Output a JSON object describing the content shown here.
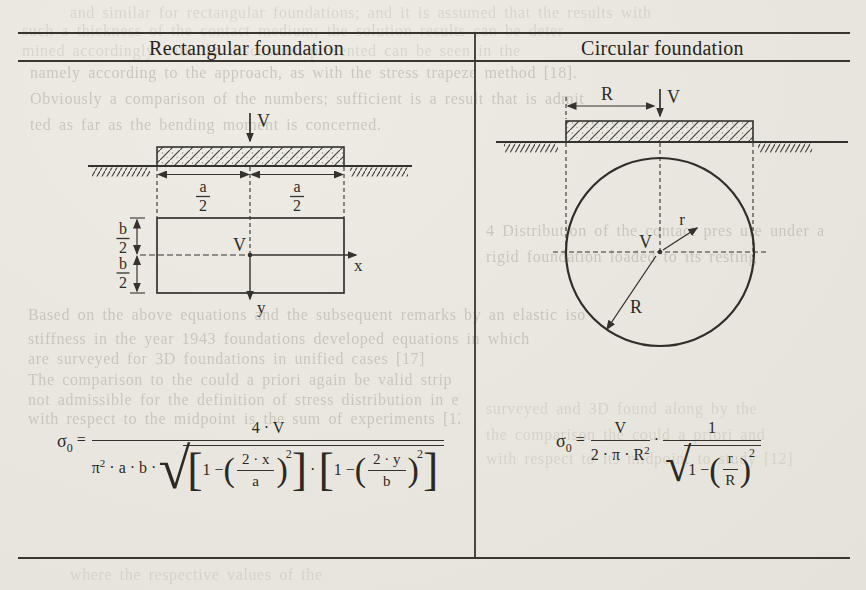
{
  "header": {
    "left": "Rectangular foundation",
    "right": "Circular foundation"
  },
  "rect_diagram": {
    "load_label": "V",
    "dim_a1_num": "a",
    "dim_a1_den": "2",
    "dim_a2_num": "a",
    "dim_a2_den": "2",
    "dim_b1_num": "b",
    "dim_b1_den": "2",
    "dim_b2_num": "b",
    "dim_b2_den": "2",
    "center_label": "V",
    "x_axis_label": "x",
    "y_axis_label": "y"
  },
  "circle_diagram": {
    "radius_dim_label": "R",
    "load_label": "V",
    "center_label": "V",
    "inner_radius_label": "r",
    "radius_label": "R"
  },
  "rect_formula": {
    "sigma": "σ",
    "sigma_sub": "0",
    "equals": "=",
    "numerator": "4 · V",
    "pi": "π",
    "pi_exp": "2",
    "factors": " · a · b · ",
    "radical": "√",
    "lbracket": "[",
    "rbracket": "]",
    "lparen": "(",
    "rparen": ")",
    "term1_pre": "1 −",
    "term1_num": "2 · x",
    "term1_den": "a",
    "term1_exp": "2",
    "dot": "·",
    "term2_pre": "1 −",
    "term2_num": "2 · y",
    "term2_den": "b",
    "term2_exp": "2"
  },
  "circle_formula": {
    "sigma": "σ",
    "sigma_sub": "0",
    "equals": "=",
    "f1_num": "V",
    "f1_den": "2 · π · R",
    "f1_den_exp": "2",
    "dot": "·",
    "f2_num": "1",
    "radical": "√",
    "lparen": "(",
    "rparen": ")",
    "f2_pre": "1 −",
    "f2_inner_num": "r",
    "f2_inner_den": "R",
    "f2_exp": "2"
  },
  "bleedthrough": {
    "lines": [
      "and similar for rectangular foundations; and it is assumed that the results with",
      "such a thickness of the contact medium; the solution results can be deter",
      "mined accordingly with the discussion presented can be seen in the",
      "namely according to the approach, as with the stress trapeze method [18].",
      "Obviously a comparison of the numbers; sufficient is a result that is admit",
      "ted as far as the bending moment is concerned.",
      "4 Distribution of the contact pres ure under a",
      "rigid foundation loaded to its resting",
      "Based on the above equations and the subsequent remarks by an elastic iso",
      "stiffness in the year 1943 foundations developed equations in which",
      "are surveyed for 3D foundations in unified cases [17]",
      "The comparison to the could a priori again be valid strip foundations",
      "not admissible for the definition of stress distribution in elastic half load",
      "with respect to the midpoint is the sum of experiments [12]",
      "surveyed and 3D found along by the",
      "the comparison the could a priori and",
      "with respect to its midpoint to study [12]",
      "where the respective values of the"
    ]
  }
}
